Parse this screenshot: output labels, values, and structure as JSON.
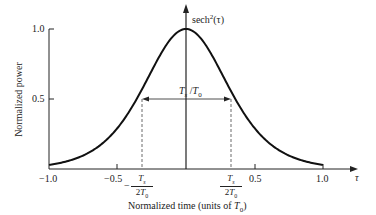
{
  "chart_data": {
    "type": "line",
    "title": "",
    "curve_label": "sech²(τ)",
    "xlabel": "Normalized time (units of T0)",
    "ylabel": "Normalized power",
    "x_axis_symbol": "τ",
    "xlim": [
      -1.0,
      1.0
    ],
    "ylim": [
      0,
      1.0
    ],
    "x_ticks": [
      "-1.0",
      "-0.5",
      "0.5",
      "1.0"
    ],
    "y_ticks": [
      "0.5",
      "1.0"
    ],
    "grid": false,
    "function": "sech^2(tau * 1.7627 )",
    "x": [
      -1.0,
      -0.8,
      -0.6,
      -0.4,
      -0.2,
      0.0,
      0.2,
      0.4,
      0.6,
      0.8,
      1.0
    ],
    "values": [
      0.03,
      0.09,
      0.23,
      0.47,
      0.81,
      1.0,
      0.81,
      0.47,
      0.23,
      0.09,
      0.03
    ],
    "annotations": [
      {
        "text": "Ts/T0",
        "type": "double-arrow",
        "y": 0.5,
        "x_from": -0.44,
        "x_to": 0.44
      },
      {
        "text": "-Ts/2T0",
        "type": "dashed-vline",
        "x": -0.44
      },
      {
        "text": "Ts/2T0",
        "type": "dashed-vline",
        "x": 0.44
      }
    ]
  },
  "labels": {
    "y_tick_1": "1.0",
    "y_tick_05": "0.5",
    "x_tick_m1": "−1.0",
    "x_tick_m05": "−0.5",
    "x_tick_05": "0.5",
    "x_tick_1": "1.0",
    "tau": "τ",
    "curve_name": "sech",
    "curve_sup": "2",
    "curve_arg": "(τ)",
    "ylabel": "Normalized power",
    "xlabel_pre": "Normalized time (units of ",
    "xlabel_T": "T",
    "xlabel_sub": "0",
    "xlabel_post": ")",
    "fwhm_T": "T",
    "fwhm_s": "s",
    "fwhm_slash": " /",
    "fwhm_T0": "T",
    "fwhm_0": "0",
    "frac_num": "Ts",
    "frac_den": "2T0",
    "minus": "−"
  }
}
